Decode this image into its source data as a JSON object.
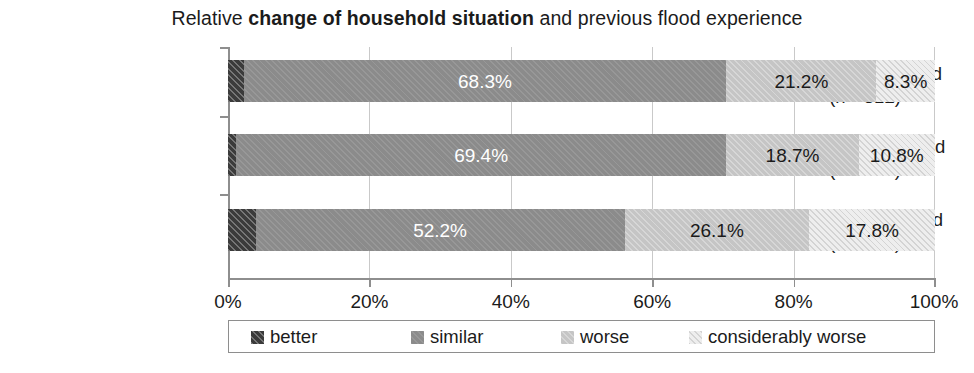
{
  "chart_data": {
    "type": "bar",
    "orientation": "horizontal",
    "stacked": true,
    "normalized_percent": true,
    "title": "Relative change of household situation and previous flood experience",
    "title_parts": {
      "prefix": "Relative ",
      "bold": "change of household situation",
      "suffix": " and previous flood experience"
    },
    "categories": [
      "2013 was 1st flood (n = 312)",
      "2013 was 2nd flood (n = 353)",
      "2013 was 3rd flood (n = 157)"
    ],
    "category_lines": [
      {
        "line1": "2013 was 1st flood",
        "line2": "(n = 312)"
      },
      {
        "line1": "2013 was 2nd flood",
        "line2": "(n = 353)"
      },
      {
        "line1": "2013 was 3rd flood",
        "line2": "(n = 157)"
      }
    ],
    "series": [
      {
        "name": "better",
        "color": "#3b3b3b",
        "values": [
          2.2,
          1.1,
          3.9
        ],
        "labels": [
          "",
          "",
          ""
        ]
      },
      {
        "name": "similar",
        "color": "#8b8b8b",
        "values": [
          68.3,
          69.4,
          52.2
        ],
        "labels": [
          "68.3%",
          "69.4%",
          "52.2%"
        ]
      },
      {
        "name": "worse",
        "color": "#c5c5c5",
        "values": [
          21.2,
          18.7,
          26.1
        ],
        "labels": [
          "21.2%",
          "18.7%",
          "26.1%"
        ]
      },
      {
        "name": "considerably worse",
        "color": "#eeeeee",
        "values": [
          8.3,
          10.8,
          17.8
        ],
        "labels": [
          "8.3%",
          "10.8%",
          "17.8%"
        ]
      }
    ],
    "xlabel": "",
    "ylabel": "",
    "xlim": [
      0,
      100
    ],
    "xticks": [
      0,
      20,
      40,
      60,
      80,
      100
    ],
    "xtick_labels": [
      "0%",
      "20%",
      "40%",
      "60%",
      "80%",
      "100%"
    ],
    "grid": true,
    "legend_position": "bottom",
    "legend_entries": [
      "better",
      "similar",
      "worse",
      "considerably worse"
    ]
  },
  "axis": {
    "ticks": [
      {
        "value": 0,
        "label": "0%"
      },
      {
        "value": 20,
        "label": "20%"
      },
      {
        "value": 40,
        "label": "40%"
      },
      {
        "value": 60,
        "label": "60%"
      },
      {
        "value": 80,
        "label": "80%"
      },
      {
        "value": 100,
        "label": "100%"
      }
    ]
  },
  "bars": [
    {
      "line1": "2013 was 1st flood",
      "line2": "(n = 312)",
      "segments": [
        {
          "series": "better",
          "value": 2.2,
          "label": ""
        },
        {
          "series": "similar",
          "value": 68.3,
          "label": "68.3%"
        },
        {
          "series": "worse",
          "value": 21.2,
          "label": "21.2%"
        },
        {
          "series": "considerably worse",
          "value": 8.3,
          "label": "8.3%"
        }
      ]
    },
    {
      "line1": "2013 was 2nd flood",
      "line2": "(n = 353)",
      "segments": [
        {
          "series": "better",
          "value": 1.1,
          "label": ""
        },
        {
          "series": "similar",
          "value": 69.4,
          "label": "69.4%"
        },
        {
          "series": "worse",
          "value": 18.7,
          "label": "18.7%"
        },
        {
          "series": "considerably worse",
          "value": 10.8,
          "label": "10.8%"
        }
      ]
    },
    {
      "line1": "2013 was 3rd flood",
      "line2": "(n = 157)",
      "segments": [
        {
          "series": "better",
          "value": 3.9,
          "label": ""
        },
        {
          "series": "similar",
          "value": 52.2,
          "label": "52.2%"
        },
        {
          "series": "worse",
          "value": 26.1,
          "label": "26.1%"
        },
        {
          "series": "considerably worse",
          "value": 17.8,
          "label": "17.8%"
        }
      ]
    }
  ],
  "legend": {
    "items": [
      {
        "label": "better",
        "color": "#3b3b3b"
      },
      {
        "label": "similar",
        "color": "#8b8b8b"
      },
      {
        "label": "worse",
        "color": "#c5c5c5"
      },
      {
        "label": "considerably worse",
        "color": "#eeeeee"
      }
    ]
  }
}
